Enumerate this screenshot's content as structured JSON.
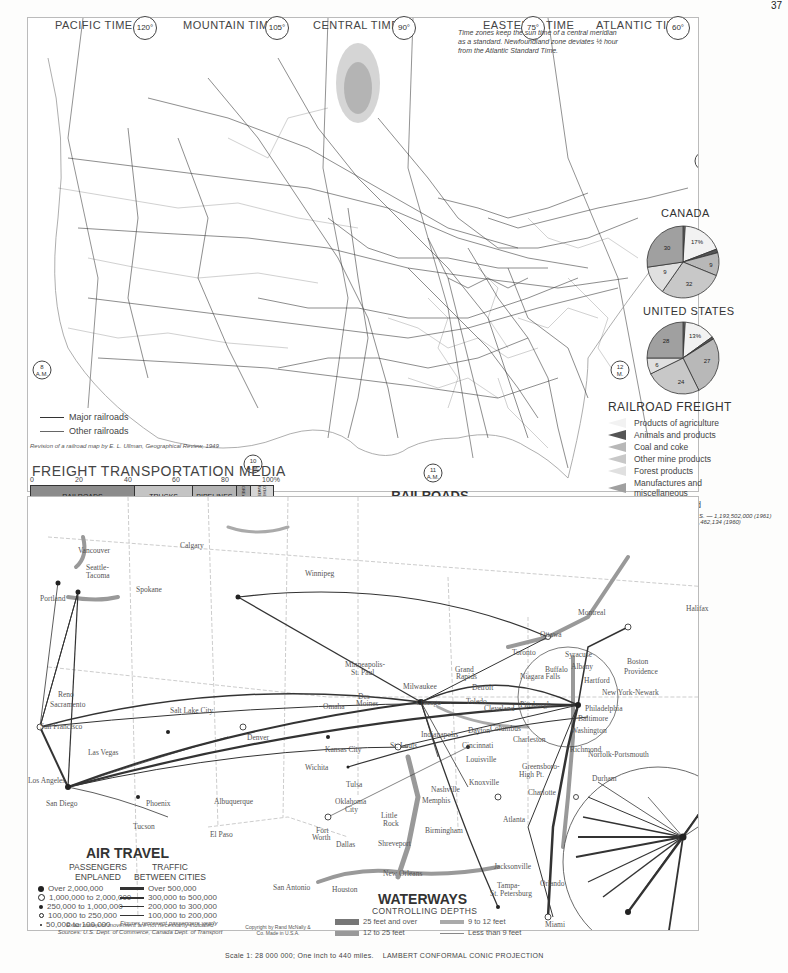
{
  "railroad_map": {
    "title": "RAILROADS",
    "subtitle": "AND STANDARD TIME",
    "time_zones": [
      {
        "label": "PACIFIC TIME",
        "meridian": "120°"
      },
      {
        "label": "MOUNTAIN TIME",
        "meridian": "105°"
      },
      {
        "label": "CENTRAL TIME",
        "meridian": "90°"
      },
      {
        "label": "EASTERN",
        "label2": "TIME",
        "meridian": "75°"
      },
      {
        "label": "ATLANTIC TIME",
        "meridian": "60°"
      }
    ],
    "time_note": "Time zones keep the sun time of a central meridian as a standard. Newfoundland zone deviates ½ hour from the Atlantic Standard Time.",
    "clock_markers": [
      "8 A.M.",
      "10 A.M.",
      "11 A.M.",
      "12 M.",
      "1 P.M."
    ],
    "legend": {
      "major": "Major railroads",
      "other": "Other railroads"
    },
    "credit": "Revision of a railroad map by E. L. Ullman, Geographical Review, 1949",
    "longitude_label": "Longitude West of Greenwich",
    "copyright": "Copyright by Rand McNally & Co. Made in U.S.A."
  },
  "freight_media": {
    "title": "FREIGHT TRANSPORTATION MEDIA",
    "axis_ticks": [
      "0",
      "20",
      "40",
      "60",
      "80",
      "100%"
    ],
    "segments": [
      {
        "label": "RAILROADS",
        "value": "43%",
        "pct": 43,
        "color": "#8c8c8c"
      },
      {
        "label": "TRUCKS",
        "value": "24",
        "pct": 24,
        "color": "#c4c4c4"
      },
      {
        "label": "PIPELINES",
        "value": "18",
        "pct": 18,
        "color": "#b3b3b3"
      },
      {
        "label": "GREAT LAKES",
        "value": "6",
        "pct": 6,
        "color": "#a6a6a6"
      },
      {
        "label": "OTHER WATERWAYS",
        "value": "9",
        "pct": 9,
        "color": "#d5d5d5"
      }
    ],
    "footnote": "U.S. Total 1961—1,326,911,000,000 ton miles. Air less than 1%"
  },
  "railroad_freight": {
    "title": "RAILROAD FREIGHT",
    "categories": [
      {
        "label": "Products of agriculture",
        "color": "#f2f2f2"
      },
      {
        "label": "Animals and products",
        "color": "#555555"
      },
      {
        "label": "Coal and coke",
        "color": "#b8b8b8"
      },
      {
        "label": "Other mine products",
        "color": "#c8c8c8"
      },
      {
        "label": "Forest products",
        "color": "#e0e0e0"
      },
      {
        "label": "Manufactures and miscellaneous",
        "color": "#a0a0a0"
      },
      {
        "label": "Less than carload",
        "color": "#7a7a7a"
      }
    ],
    "footnote_us": "Total short tons hauled in U.S. — 1,193,502,000 (1961)",
    "footnote_canada": "in Canada—158,462,134 (1960)"
  },
  "chart_data": [
    {
      "type": "pie",
      "title": "CANADA",
      "labels": [
        "Less than carload",
        "Products of agriculture",
        "Animals and products",
        "Coal and coke",
        "Other mine products",
        "Forest products",
        "Manufactures and miscellaneous"
      ],
      "values": [
        1,
        17,
        1,
        9,
        32,
        9,
        30
      ],
      "display_labels": [
        "",
        "17%",
        "",
        "9",
        "32",
        "9",
        "30"
      ]
    },
    {
      "type": "pie",
      "title": "UNITED STATES",
      "labels": [
        "Less than carload",
        "Products of agriculture",
        "Animals and products",
        "Coal and coke",
        "Other mine products",
        "Forest products",
        "Manufactures and miscellaneous"
      ],
      "values": [
        1,
        13,
        1,
        27,
        24,
        6,
        28
      ],
      "display_labels": [
        "",
        "13%",
        "",
        "27",
        "24",
        "6",
        "28"
      ]
    },
    {
      "type": "bar",
      "title": "FREIGHT TRANSPORTATION MEDIA",
      "categories": [
        "Railroads",
        "Trucks",
        "Pipelines",
        "Great Lakes",
        "Other waterways"
      ],
      "values": [
        43,
        24,
        18,
        6,
        9
      ],
      "xlabel": "",
      "ylabel": "% of ton miles",
      "ylim": [
        0,
        100
      ]
    }
  ],
  "air_map": {
    "title": "AIR TRAVEL",
    "passengers": {
      "title1": "PASSENGERS",
      "title2": "ENPLANED",
      "items": [
        "Over 2,000,000",
        "1,000,000 to 2,000,000",
        "250,000 to 1,000,000",
        "100,000 to 250,000",
        "50,000 to 100,000"
      ]
    },
    "traffic": {
      "title1": "TRAFFIC",
      "title2": "BETWEEN CITIES",
      "items": [
        "Over 500,000",
        "300,000 to 500,000",
        "200,000 to 300,000",
        "100,000 to 200,000"
      ],
      "note": "Figures represent passengers yearly"
    },
    "notes": [
      "Exact routes of movement are not necessarily indicated",
      "Sources: U.S. Dept. of Commerce, Canada Dept. of Transport"
    ],
    "cities": [
      {
        "name": "Vancouver",
        "x": 78,
        "y": 546
      },
      {
        "name": "Calgary",
        "x": 180,
        "y": 541
      },
      {
        "name": "Seattle-",
        "x": 86,
        "y": 563
      },
      {
        "name": "Tacoma",
        "x": 86,
        "y": 571
      },
      {
        "name": "Spokane",
        "x": 136,
        "y": 585
      },
      {
        "name": "Portland",
        "x": 40,
        "y": 594
      },
      {
        "name": "Winnipeg",
        "x": 305,
        "y": 569
      },
      {
        "name": "Reno",
        "x": 58,
        "y": 690
      },
      {
        "name": "Sacramento",
        "x": 50,
        "y": 700
      },
      {
        "name": "San Francisco",
        "x": 40,
        "y": 722
      },
      {
        "name": "Salt Lake City",
        "x": 170,
        "y": 706
      },
      {
        "name": "Denver",
        "x": 247,
        "y": 733
      },
      {
        "name": "Las Vegas",
        "x": 88,
        "y": 748
      },
      {
        "name": "Los Angeles",
        "x": 28,
        "y": 776
      },
      {
        "name": "San Diego",
        "x": 46,
        "y": 799
      },
      {
        "name": "Phoenix",
        "x": 146,
        "y": 799
      },
      {
        "name": "Tucson",
        "x": 133,
        "y": 822
      },
      {
        "name": "Albuquerque",
        "x": 214,
        "y": 797
      },
      {
        "name": "El Paso",
        "x": 210,
        "y": 830
      },
      {
        "name": "Minneapolis-",
        "x": 345,
        "y": 660
      },
      {
        "name": "St. Paul",
        "x": 351,
        "y": 668
      },
      {
        "name": "Omaha",
        "x": 323,
        "y": 702
      },
      {
        "name": "Des",
        "x": 358,
        "y": 692
      },
      {
        "name": "Moines",
        "x": 356,
        "y": 699
      },
      {
        "name": "Milwaukee",
        "x": 403,
        "y": 682
      },
      {
        "name": "Grand",
        "x": 455,
        "y": 665
      },
      {
        "name": "Rapids",
        "x": 456,
        "y": 672
      },
      {
        "name": "Chicago",
        "x": 416,
        "y": 698
      },
      {
        "name": "Detroit",
        "x": 472,
        "y": 683
      },
      {
        "name": "Toledo",
        "x": 466,
        "y": 697
      },
      {
        "name": "Cleveland",
        "x": 484,
        "y": 704
      },
      {
        "name": "Toronto",
        "x": 512,
        "y": 648
      },
      {
        "name": "Ottawa",
        "x": 540,
        "y": 630
      },
      {
        "name": "Montreal",
        "x": 578,
        "y": 608
      },
      {
        "name": "Halifax",
        "x": 686,
        "y": 604
      },
      {
        "name": "Syracuse",
        "x": 565,
        "y": 650
      },
      {
        "name": "Albany",
        "x": 571,
        "y": 662
      },
      {
        "name": "Buffalo",
        "x": 545,
        "y": 665
      },
      {
        "name": "Niagara Falls",
        "x": 520,
        "y": 672
      },
      {
        "name": "Boston",
        "x": 627,
        "y": 657
      },
      {
        "name": "Providence",
        "x": 624,
        "y": 667
      },
      {
        "name": "Hartford",
        "x": 584,
        "y": 676
      },
      {
        "name": "New York-Newark",
        "x": 602,
        "y": 688
      },
      {
        "name": "Philadelphia",
        "x": 585,
        "y": 704
      },
      {
        "name": "Baltimore",
        "x": 578,
        "y": 714
      },
      {
        "name": "Washington",
        "x": 571,
        "y": 726
      },
      {
        "name": "Pittsburgh",
        "x": 520,
        "y": 700
      },
      {
        "name": "Indianapolis",
        "x": 421,
        "y": 730
      },
      {
        "name": "Dayton",
        "x": 468,
        "y": 726
      },
      {
        "name": "Columbus",
        "x": 490,
        "y": 724
      },
      {
        "name": "Cincinnati",
        "x": 462,
        "y": 741
      },
      {
        "name": "Charleston",
        "x": 513,
        "y": 735
      },
      {
        "name": "Louisville",
        "x": 466,
        "y": 755
      },
      {
        "name": "Richmond",
        "x": 570,
        "y": 745
      },
      {
        "name": "Norfolk-Portsmouth",
        "x": 588,
        "y": 750
      },
      {
        "name": "Kansas City",
        "x": 325,
        "y": 745
      },
      {
        "name": "St. Louis",
        "x": 390,
        "y": 741
      },
      {
        "name": "Wichita",
        "x": 305,
        "y": 763
      },
      {
        "name": "Greensboro-",
        "x": 522,
        "y": 762
      },
      {
        "name": "High Pt.",
        "x": 519,
        "y": 770
      },
      {
        "name": "Durham",
        "x": 592,
        "y": 774
      },
      {
        "name": "Knoxville",
        "x": 469,
        "y": 778
      },
      {
        "name": "Nashville",
        "x": 431,
        "y": 785
      },
      {
        "name": "Charlotte",
        "x": 528,
        "y": 788
      },
      {
        "name": "Tulsa",
        "x": 346,
        "y": 780
      },
      {
        "name": "Memphis",
        "x": 422,
        "y": 796
      },
      {
        "name": "Oklahoma",
        "x": 335,
        "y": 797
      },
      {
        "name": "City",
        "x": 345,
        "y": 805
      },
      {
        "name": "Little",
        "x": 381,
        "y": 811
      },
      {
        "name": "Rock",
        "x": 383,
        "y": 819
      },
      {
        "name": "Atlanta",
        "x": 503,
        "y": 815
      },
      {
        "name": "Birmingham",
        "x": 425,
        "y": 826
      },
      {
        "name": "Fort",
        "x": 316,
        "y": 826
      },
      {
        "name": "Worth",
        "x": 312,
        "y": 833
      },
      {
        "name": "Dallas",
        "x": 336,
        "y": 840
      },
      {
        "name": "Shreveport",
        "x": 378,
        "y": 839
      },
      {
        "name": "San Antonio",
        "x": 273,
        "y": 883
      },
      {
        "name": "Houston",
        "x": 332,
        "y": 885
      },
      {
        "name": "New Orleans",
        "x": 383,
        "y": 869
      },
      {
        "name": "Jacksonville",
        "x": 494,
        "y": 862
      },
      {
        "name": "Tampa-",
        "x": 497,
        "y": 881
      },
      {
        "name": "St. Petersburg",
        "x": 490,
        "y": 889
      },
      {
        "name": "Orlando",
        "x": 540,
        "y": 879
      },
      {
        "name": "Miami",
        "x": 545,
        "y": 920
      }
    ],
    "inset_cities": [
      "Toronto",
      "Syracuse",
      "Albany",
      "Boston",
      "Rochester",
      "Buffalo",
      "Niagara Falls",
      "Hartford-Springfield",
      "Providence",
      "New York-Newark",
      "Pittsburgh",
      "Philadelphia",
      "Baltimore",
      "Washington"
    ],
    "copyright": "Copyright by Rand McNally & Co. Made in U.S.A."
  },
  "waterways": {
    "title": "WATERWAYS",
    "subtitle": "CONTROLLING DEPTHS",
    "items": [
      {
        "label": "25 feet and over",
        "width": 6,
        "color": "#777"
      },
      {
        "label": "9 to 12 feet",
        "width": 4,
        "color": "#aaa"
      },
      {
        "label": "12 to 25 feet",
        "width": 5,
        "color": "#999"
      },
      {
        "label": "Less than 9 feet",
        "width": 1.5,
        "color": "#888"
      }
    ]
  },
  "footer": {
    "scale": "Scale 1: 28 000 000; One inch to 440 miles.",
    "projection": "LAMBERT CONFORMAL CONIC PROJECTION"
  },
  "page_number": "37"
}
